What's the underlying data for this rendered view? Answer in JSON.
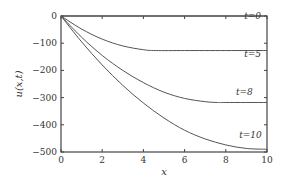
{
  "chart_data": {
    "type": "line",
    "title": "",
    "xlabel": "x",
    "ylabel": "u(x,t)",
    "xlim": [
      0,
      10
    ],
    "ylim": [
      -500,
      0
    ],
    "xticks": [
      0,
      2,
      4,
      6,
      8,
      10
    ],
    "yticks": [
      0,
      -100,
      -200,
      -300,
      -400,
      -500
    ],
    "xtick_labels": [
      "0",
      "2",
      "4",
      "6",
      "8",
      "10"
    ],
    "ytick_labels": [
      "0",
      "−100",
      "−200",
      "−300",
      "−400",
      "−500"
    ],
    "grid": false,
    "series": [
      {
        "name": "t=0",
        "x": [
          0,
          10
        ],
        "y": [
          0,
          0
        ]
      },
      {
        "name": "t=5",
        "x": [
          0,
          1,
          2,
          3,
          4,
          4.6,
          6,
          8,
          10
        ],
        "y": [
          0,
          -48,
          -85,
          -110,
          -124,
          -127,
          -127,
          -127,
          -127
        ]
      },
      {
        "name": "t=8",
        "x": [
          0,
          1,
          2,
          3,
          4,
          5,
          6,
          7,
          7.6,
          8,
          10
        ],
        "y": [
          0,
          -78,
          -145,
          -200,
          -245,
          -280,
          -303,
          -315,
          -318,
          -318,
          -318
        ]
      },
      {
        "name": "t=10",
        "x": [
          0,
          1,
          2,
          3,
          4,
          5,
          6,
          7,
          8,
          9,
          10
        ],
        "y": [
          0,
          -95,
          -180,
          -255,
          -320,
          -375,
          -420,
          -452,
          -474,
          -487,
          -490
        ]
      }
    ],
    "annotations": [
      {
        "text": "t=0",
        "x": 9.3,
        "y": -10
      },
      {
        "text": "t=5",
        "x": 9.3,
        "y": -150
      },
      {
        "text": "t=8",
        "x": 8.9,
        "y": -290
      },
      {
        "text": "t=10",
        "x": 9.2,
        "y": -450
      }
    ]
  }
}
